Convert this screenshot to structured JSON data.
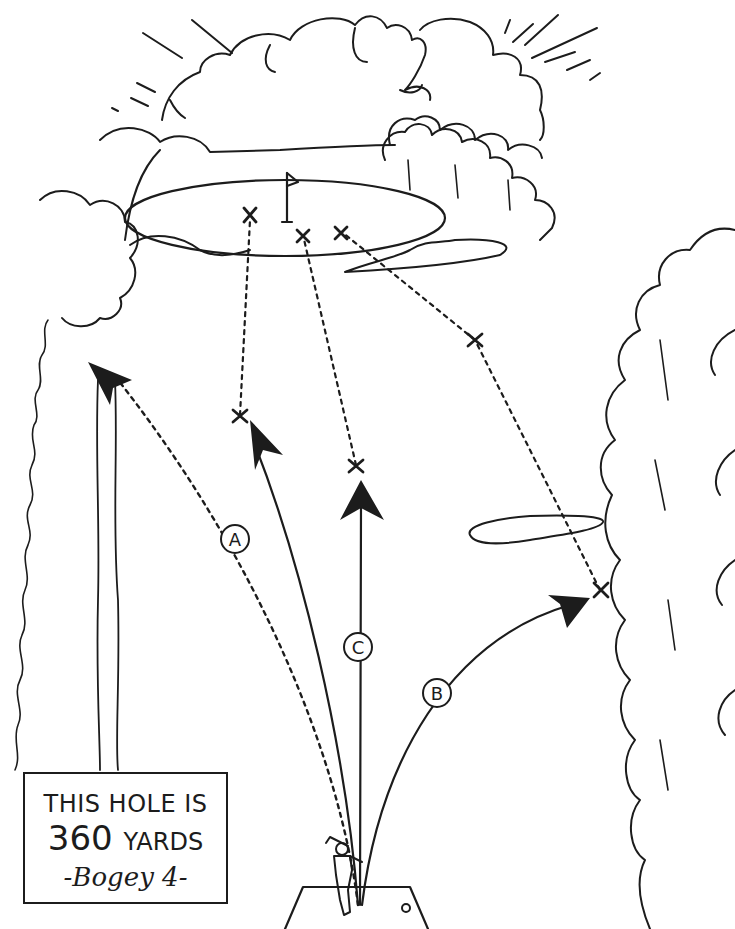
{
  "illustration": {
    "subject": "golf hole diagram",
    "caption": {
      "line1": "THIS HOLE IS",
      "line2_number": "360",
      "line2_unit": "YARDS",
      "line3": "-Bogey 4-"
    },
    "shot_labels": {
      "a": "A",
      "b": "B",
      "c": "C"
    }
  }
}
